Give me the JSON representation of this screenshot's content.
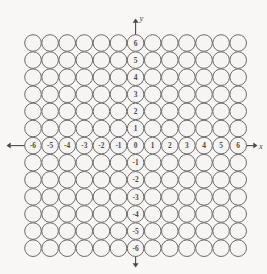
{
  "figure": {
    "background_color": "#f8f7f5",
    "circle_fill": "#f6f5f3",
    "circle_stroke": "#6b6b6b",
    "label_color": "#4a4a4a",
    "axis_color": "#4a4a4a"
  },
  "axes": {
    "x_label": "x",
    "y_label": "y",
    "origin_label": "0",
    "arrow_left": "arrow-left-icon",
    "arrow_right": "arrow-right-icon",
    "arrow_up": "arrow-up-icon",
    "arrow_down": "arrow-down-icon"
  },
  "chart_data": {
    "type": "scatter",
    "xlabel": "x",
    "ylabel": "y",
    "xlim": [
      -6,
      6
    ],
    "ylim": [
      -6,
      6
    ],
    "grid": false,
    "legend": "none",
    "marker": "circle-open",
    "x_tick_labels": [
      "-6",
      "-5",
      "-4",
      "-3",
      "-2",
      "-1",
      "0",
      "1",
      "2",
      "3",
      "4",
      "5",
      "6"
    ],
    "y_tick_labels": [
      "6",
      "5",
      "4",
      "3",
      "2",
      "1",
      "0",
      "-1",
      "-2",
      "-3",
      "-4",
      "-5",
      "-6"
    ],
    "columns": 13,
    "rows": 13,
    "x": [
      -6,
      -5,
      -4,
      -3,
      -2,
      -1,
      0,
      1,
      2,
      3,
      4,
      5,
      6
    ],
    "y": [
      6,
      5,
      4,
      3,
      2,
      1,
      0,
      -1,
      -2,
      -3,
      -4,
      -5,
      -6
    ],
    "labeled_points": [
      {
        "x": -6,
        "y": 0,
        "label": "-6"
      },
      {
        "x": -5,
        "y": 0,
        "label": "-5"
      },
      {
        "x": -4,
        "y": 0,
        "label": "-4"
      },
      {
        "x": -3,
        "y": 0,
        "label": "-3"
      },
      {
        "x": -2,
        "y": 0,
        "label": "-2"
      },
      {
        "x": -1,
        "y": 0,
        "label": "-1"
      },
      {
        "x": 0,
        "y": 0,
        "label": "0"
      },
      {
        "x": 1,
        "y": 0,
        "label": "1"
      },
      {
        "x": 2,
        "y": 0,
        "label": "2"
      },
      {
        "x": 3,
        "y": 0,
        "label": "3"
      },
      {
        "x": 4,
        "y": 0,
        "label": "4"
      },
      {
        "x": 5,
        "y": 0,
        "label": "5"
      },
      {
        "x": 6,
        "y": 0,
        "label": "6"
      },
      {
        "x": 0,
        "y": 6,
        "label": "6"
      },
      {
        "x": 0,
        "y": 5,
        "label": "5"
      },
      {
        "x": 0,
        "y": 4,
        "label": "4"
      },
      {
        "x": 0,
        "y": 3,
        "label": "3"
      },
      {
        "x": 0,
        "y": 2,
        "label": "2"
      },
      {
        "x": 0,
        "y": 1,
        "label": "1"
      },
      {
        "x": 0,
        "y": -1,
        "label": "-1"
      },
      {
        "x": 0,
        "y": -2,
        "label": "-2"
      },
      {
        "x": 0,
        "y": -3,
        "label": "-3"
      },
      {
        "x": 0,
        "y": -4,
        "label": "-4"
      },
      {
        "x": 0,
        "y": -5,
        "label": "-5"
      },
      {
        "x": 0,
        "y": -6,
        "label": "-6"
      }
    ]
  },
  "geometry": {
    "origin_px_x": 135.6,
    "origin_px_y": 145.6,
    "pitch": 17.1,
    "radius": 8.3
  }
}
